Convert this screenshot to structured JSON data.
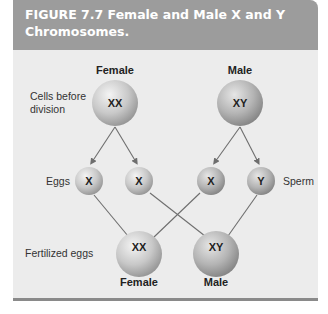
{
  "figure": {
    "title": "FIGURE 7.7  Female and Male X and Y Chromosomes."
  },
  "columns": {
    "female": "Female",
    "male": "Male"
  },
  "row_labels": {
    "cells_before_division": "Cells before division",
    "eggs": "Eggs",
    "sperm": "Sperm",
    "fertilized_eggs": "Fertilized eggs"
  },
  "cells": {
    "female_parent": "XX",
    "male_parent": "XY",
    "egg_1": "X",
    "egg_2": "X",
    "sperm_1": "X",
    "sperm_2": "Y",
    "offspring_female": "XX",
    "offspring_male": "XY"
  },
  "offspring_labels": {
    "female": "Female",
    "male": "Male"
  },
  "colors": {
    "header_bg": "#9c9c9c",
    "panel_bg": "#ececec",
    "rule": "#8a8a8a",
    "line": "#6e6e6e"
  }
}
